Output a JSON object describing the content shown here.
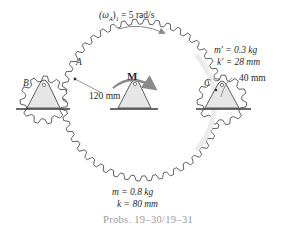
{
  "figure": {
    "omega_label": "(ωA)1 = 5 rad/s",
    "omega_parts": {
      "symbol": "(ω",
      "sub": "A",
      "close": ")",
      "sub2": "1",
      "value": " = 5 rad/s"
    },
    "moment_label": "M",
    "point_labels": {
      "A": "A",
      "B": "B",
      "C": "C"
    },
    "radius_large": "120 mm",
    "radius_small": "40 mm",
    "small_gear": {
      "mass": "m′ = 0.3 kg",
      "gyration": "k′ = 28 mm"
    },
    "large_gear": {
      "mass": "m = 0.8 kg",
      "gyration": "k = 80 mm"
    },
    "caption": "Probs. 19–30/19–31"
  },
  "colors": {
    "line": "#3a3a3a",
    "arrow": "#8a8a8a",
    "support_fill": "#e6e6e6",
    "caption": "#9a9a9a"
  }
}
